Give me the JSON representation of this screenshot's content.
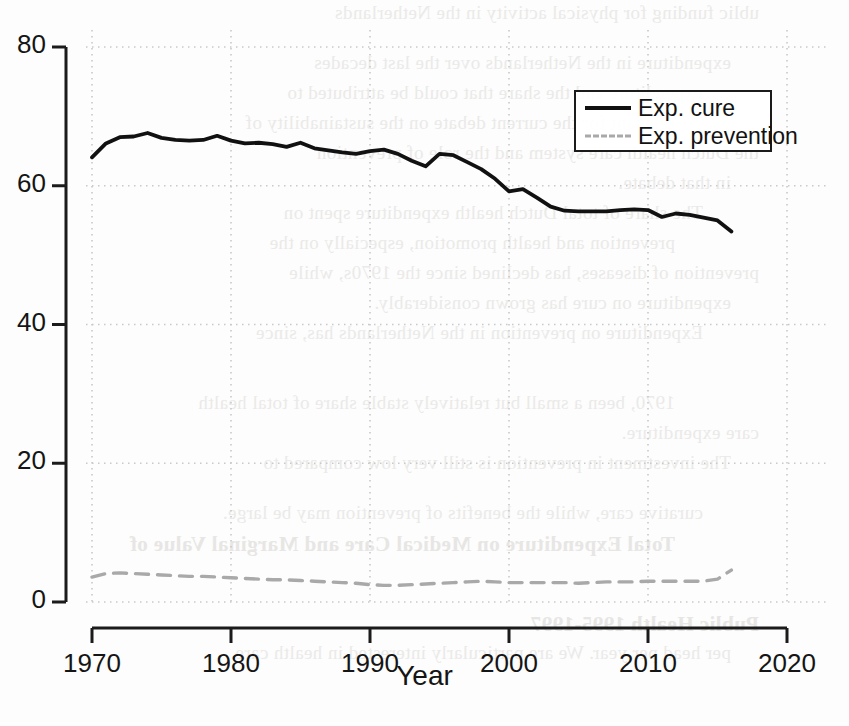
{
  "figure": {
    "axis_title_x": "Year",
    "axis_title_y": "",
    "y_tick_labels": [
      "0",
      "20",
      "40",
      "60",
      "80"
    ],
    "x_tick_labels": [
      "1970",
      "1980",
      "1990",
      "2000",
      "2010",
      "2020"
    ],
    "legend": {
      "entries": [
        {
          "label": "Exp. cure",
          "style": "solid",
          "color": "#111111"
        },
        {
          "label": "Exp. prevention",
          "style": "dashed",
          "color": "#a9a9a9"
        }
      ]
    },
    "colors": {
      "cure_line": "#111111",
      "prevention_line": "#a9a9a9",
      "axis": "#1b1b1b",
      "grid": "#c9c9c9",
      "background": "#fdfdfd"
    }
  },
  "background_text": {
    "note": "faint bleed-through text from the reverse side of the scanned page",
    "lines": [
      "ublic funding for physical activity in the Netherlands",
      "expenditure in the Netherlands over the last decades",
      "expenditure and the share that could be attributed to",
      "relevant for the current debate on the sustainability of",
      "the Dutch health care system and the role of prevention",
      "in that debate.",
      "The share of total Dutch health expenditure spent on",
      "prevention and health promotion, especially on the",
      "prevention of diseases, has declined since the 1970s, while",
      "expenditure on cure has grown considerably.",
      "Expenditure on prevention in the Netherlands has, since",
      "1970, been a small but relatively stable share of total health",
      "care expenditure.",
      "The investment in prevention is still very low compared to",
      "curative care, while the benefits of prevention may be large.",
      "Total Expenditure on Medical Care and Marginal Value of",
      "Public Health 1995-1997",
      "per head per year. We are particularly interested in health care"
    ]
  },
  "chart_data": {
    "type": "line",
    "title": "",
    "xlabel": "Year",
    "ylabel": "",
    "xlim": [
      1970,
      2020
    ],
    "ylim": [
      0,
      80
    ],
    "xticks": [
      1970,
      1980,
      1990,
      2000,
      2010,
      2020
    ],
    "yticks": [
      0,
      20,
      40,
      60,
      80
    ],
    "grid": true,
    "legend_position": "upper right",
    "x": [
      1970,
      1971,
      1972,
      1973,
      1974,
      1975,
      1976,
      1977,
      1978,
      1979,
      1980,
      1981,
      1982,
      1983,
      1984,
      1985,
      1986,
      1987,
      1988,
      1989,
      1990,
      1991,
      1992,
      1993,
      1994,
      1995,
      1996,
      1997,
      1998,
      1999,
      2000,
      2001,
      2002,
      2003,
      2004,
      2005,
      2006,
      2007,
      2008,
      2009,
      2010,
      2011,
      2012,
      2013,
      2014,
      2015,
      2016
    ],
    "series": [
      {
        "name": "Exp. cure",
        "style": "solid",
        "color": "#111111",
        "values": [
          64.1,
          66.1,
          67.0,
          67.1,
          67.6,
          66.9,
          66.6,
          66.5,
          66.6,
          67.2,
          66.5,
          66.1,
          66.2,
          66.0,
          65.6,
          66.2,
          65.4,
          65.1,
          64.8,
          64.6,
          65.0,
          65.2,
          64.6,
          63.6,
          62.8,
          64.6,
          64.4,
          63.4,
          62.4,
          61.0,
          59.2,
          59.5,
          58.3,
          57.0,
          56.4,
          56.3,
          56.3,
          56.3,
          56.5,
          56.6,
          56.5,
          55.5,
          56.0,
          55.8,
          55.4,
          55.0,
          53.4
        ]
      },
      {
        "name": "Exp. prevention",
        "style": "dashed",
        "color": "#a9a9a9",
        "values": [
          3.6,
          4.1,
          4.2,
          4.1,
          4.0,
          3.9,
          3.8,
          3.7,
          3.7,
          3.6,
          3.5,
          3.4,
          3.3,
          3.2,
          3.2,
          3.1,
          3.0,
          2.9,
          2.8,
          2.7,
          2.5,
          2.4,
          2.4,
          2.5,
          2.6,
          2.7,
          2.8,
          2.9,
          3.0,
          2.9,
          2.8,
          2.8,
          2.8,
          2.8,
          2.8,
          2.7,
          2.8,
          2.9,
          2.9,
          2.9,
          3.0,
          3.0,
          3.0,
          3.0,
          3.0,
          3.3,
          4.6
        ]
      }
    ]
  }
}
